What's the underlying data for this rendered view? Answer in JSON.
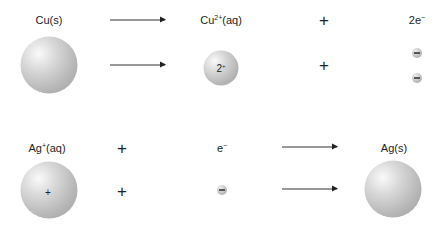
{
  "reactions": {
    "oxidation": {
      "reactant_label": "Cu(s)",
      "product_ion_label_base": "Cu",
      "product_ion_label_sup": "2+",
      "product_ion_label_suffix": "(aq)",
      "plus": "+",
      "electrons_label_base": "2e",
      "electrons_label_sup": "−",
      "ion_charge_base": "2",
      "ion_charge_sup": "+",
      "electron_count": 2
    },
    "reduction": {
      "reactant_ion_label_base": "Ag",
      "reactant_ion_label_sup": "+",
      "reactant_ion_label_suffix": "(aq)",
      "plus": "+",
      "electron_label_base": "e",
      "electron_label_sup": "−",
      "product_label": "Ag(s)",
      "ion_charge": "+",
      "electron_count": 1
    }
  },
  "colors": {
    "sphere": "#b8b8b8",
    "arrow": "#333333",
    "text": "#222222"
  }
}
